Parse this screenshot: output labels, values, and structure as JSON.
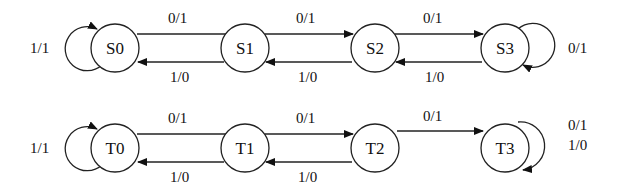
{
  "diagram": {
    "type": "state-transition-diagram",
    "rows": [
      {
        "name": "machine-S",
        "states": [
          {
            "id": "S0",
            "label": "S0"
          },
          {
            "id": "S1",
            "label": "S1"
          },
          {
            "id": "S2",
            "label": "S2"
          },
          {
            "id": "S3",
            "label": "S3"
          }
        ],
        "transitions": [
          {
            "from": "S0",
            "to": "S0",
            "label": "1/1"
          },
          {
            "from": "S0",
            "to": "S1",
            "label": "0/1"
          },
          {
            "from": "S1",
            "to": "S0",
            "label": "1/0"
          },
          {
            "from": "S1",
            "to": "S2",
            "label": "0/1"
          },
          {
            "from": "S2",
            "to": "S1",
            "label": "1/0"
          },
          {
            "from": "S2",
            "to": "S3",
            "label": "0/1"
          },
          {
            "from": "S3",
            "to": "S2",
            "label": "1/0"
          },
          {
            "from": "S3",
            "to": "S3",
            "label": "0/1"
          }
        ]
      },
      {
        "name": "machine-T",
        "states": [
          {
            "id": "T0",
            "label": "T0"
          },
          {
            "id": "T1",
            "label": "T1"
          },
          {
            "id": "T2",
            "label": "T2"
          },
          {
            "id": "T3",
            "label": "T3"
          }
        ],
        "transitions": [
          {
            "from": "T0",
            "to": "T0",
            "label": "1/1"
          },
          {
            "from": "T0",
            "to": "T1",
            "label": "0/1"
          },
          {
            "from": "T1",
            "to": "T0",
            "label": "1/0"
          },
          {
            "from": "T1",
            "to": "T2",
            "label": "0/1"
          },
          {
            "from": "T2",
            "to": "T1",
            "label": "1/0"
          },
          {
            "from": "T2",
            "to": "T3",
            "label": "0/1"
          },
          {
            "from": "T3",
            "to": "T3",
            "label": "0/1"
          },
          {
            "from": "T3",
            "to": "T3",
            "label2": "1/0"
          }
        ],
        "t3_self_loop_labels": [
          "0/1",
          "1/0"
        ]
      }
    ]
  }
}
